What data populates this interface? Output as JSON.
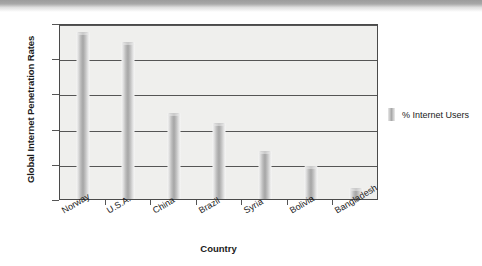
{
  "chart_data": {
    "type": "bar",
    "title": "",
    "subtitle": "",
    "categories": [
      "Norway",
      "U.S.A.",
      "China",
      "Brazil",
      "Syria",
      "Bolivia",
      "Bangladesh"
    ],
    "values": [
      95,
      89,
      49,
      43,
      27,
      19,
      6
    ],
    "series": [
      {
        "name": "% Internet Users",
        "values": [
          95,
          89,
          49,
          43,
          27,
          19,
          6
        ]
      }
    ],
    "xlabel": "Country",
    "ylabel": "Global Internet Penetration Rates",
    "ylim": [
      0,
      100
    ],
    "ytick_labels": [
      "0%",
      "20%",
      "40%",
      "60%",
      "80%",
      "100%"
    ],
    "ytick_values": [
      0,
      20,
      40,
      60,
      80,
      100
    ],
    "grid": true,
    "legend_position": "right",
    "legend_entries": [
      "% Internet Users"
    ],
    "bar_color": "#a9a9a9",
    "plot_background": "#efefed",
    "axis_color": "#4a4a4a",
    "gridline_color": "#555555"
  },
  "legend": {
    "swatch_name": "legend-color-swatch",
    "label": "% Internet Users"
  },
  "axes": {
    "y_title": "Global Internet Penetration Rates",
    "x_title": "Country"
  }
}
